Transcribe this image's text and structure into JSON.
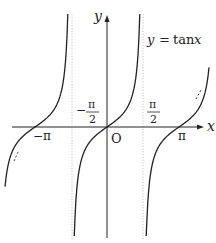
{
  "chart_data": {
    "type": "line",
    "title": "y = tan x",
    "function": "tan",
    "xlabel": "x",
    "ylabel": "y",
    "origin_label": "O",
    "x_tick_labels": [
      {
        "value": -3.14159,
        "label": "−π",
        "position": "below"
      },
      {
        "value": -1.5708,
        "label": "−π/2",
        "position": "above",
        "numerator": "π",
        "denominator": "2",
        "sign": "−"
      },
      {
        "value": 1.5708,
        "label": "π/2",
        "position": "above",
        "numerator": "π",
        "denominator": "2",
        "sign": ""
      },
      {
        "value": 3.14159,
        "label": "π",
        "position": "below"
      }
    ],
    "asymptotes": [
      -1.5708,
      1.5708
    ],
    "series": [
      {
        "name": "branch-left",
        "x_range": [
          -4.45,
          -1.71
        ],
        "points": [
          [
            -4.45,
            -3.3
          ],
          [
            -3.93,
            -1.0
          ],
          [
            -3.14159,
            0
          ],
          [
            -2.36,
            1.0
          ],
          [
            -1.71,
            7.1
          ]
        ]
      },
      {
        "name": "branch-center",
        "x_range": [
          -1.43,
          1.43
        ],
        "points": [
          [
            -1.43,
            -7.1
          ],
          [
            -0.785,
            -1.0
          ],
          [
            0,
            0
          ],
          [
            0.785,
            1.0
          ],
          [
            1.43,
            7.1
          ]
        ]
      },
      {
        "name": "branch-right",
        "x_range": [
          1.71,
          4.45
        ],
        "points": [
          [
            1.71,
            -7.1
          ],
          [
            2.36,
            -1.0
          ],
          [
            3.14159,
            0
          ],
          [
            3.93,
            1.0
          ],
          [
            4.45,
            3.3
          ]
        ]
      }
    ],
    "xlim": [
      -4.6,
      4.6
    ],
    "ylim": [
      -5,
      5
    ],
    "grid": false,
    "legend": "none"
  },
  "labels": {
    "title": "y = tan x",
    "title_y": "y",
    "title_eq": "=",
    "title_fn": "tan",
    "title_x": "x",
    "x_axis": "x",
    "y_axis": "y",
    "origin": "O",
    "neg_pi": "−π",
    "pi": "π",
    "neg_half_sign": "−",
    "half_num": "π",
    "half_den": "2"
  },
  "colors": {
    "curve": "#222222",
    "axis": "#222222",
    "asymptote": "#bbbbbb"
  }
}
